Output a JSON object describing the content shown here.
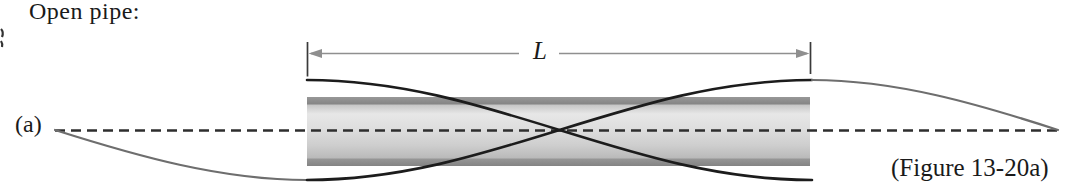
{
  "figure": {
    "title": "Open pipe:",
    "panel_label": "(a)",
    "length_label": "L",
    "caption": "(Figure 13-20a)",
    "type": "standing-wave-fundamental-in-open-pipe",
    "wave_description": "two mirror-image half-wave curves crossing at a node at the pipe center, antinodes at both open ends, gray extensions of one curve returning to the axis beyond the pipe"
  },
  "diagram": {
    "pipe_span_px": [
      307,
      810
    ],
    "pipe_top_px": 97,
    "pipe_bottom_px": 166,
    "axis_y_px": 130,
    "wave_amplitude_px": 50,
    "node_x_px": 558,
    "dimension_line_y_px": 53
  },
  "colors": {
    "background": "#ffffff",
    "text": "#1a1a1a",
    "pipe_band": "#8b8b8b",
    "pipe_fill_light": "#e6e6e6",
    "wave_black": "#1c1c1c",
    "wave_gray": "#6e6e6e",
    "axis_dash": "#2e2e2e",
    "dimension_line": "#8f8f8f",
    "tick": "#3a3a3a"
  }
}
